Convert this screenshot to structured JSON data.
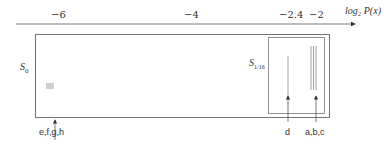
{
  "axis": {
    "label": "log₂ P(x)",
    "ticks": [
      {
        "value": "−6",
        "x": 57
      },
      {
        "value": "−4",
        "x": 190
      },
      {
        "value": "−2.4",
        "x": 290
      },
      {
        "value": "−2",
        "x": 316
      }
    ]
  },
  "sets": {
    "outer": {
      "label": "S",
      "subscript": "0"
    },
    "inner": {
      "label": "S",
      "subscript": "1/16"
    }
  },
  "groups": [
    {
      "label": "e,f,g,h",
      "x": 55
    },
    {
      "label": "d",
      "x": 288
    },
    {
      "label": "a,b,c",
      "x": 316
    }
  ]
}
